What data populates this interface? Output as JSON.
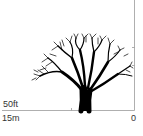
{
  "diagram": {
    "scale": {
      "height_label": "50ft",
      "width_label": "15m",
      "origin_label": "0"
    },
    "colors": {
      "tree": "#000000",
      "axis": "#9a9a9a",
      "background": "#ffffff"
    }
  }
}
